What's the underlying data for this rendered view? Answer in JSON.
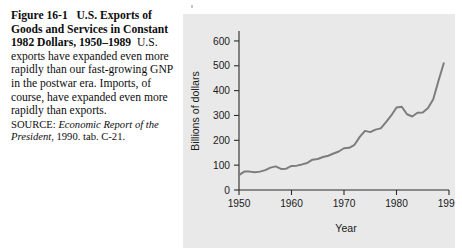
{
  "caption": {
    "lead_figure": "Figure 16-1",
    "lead_title": "U.S. Exports of Goods and Services in Constant 1982 Dollars, 1950–1989",
    "body": "U.S. exports have expanded even more rapidly than our fast-growing GNP in the postwar era. Imports, of course, have expanded even more rapidly than exports.",
    "source_label": "SOURCE: ",
    "source_title": "Economic Report of the President",
    "source_rest": ", 1990. tab. C-21."
  },
  "colors": {
    "panel_background": "#e9e9e9",
    "series_line": "#7d7d7d",
    "axis": "#2b2b2b",
    "text": "#1a1a1a"
  },
  "chart_data": {
    "type": "line",
    "title": "",
    "xlabel": "Year",
    "ylabel": "Billions of dollars",
    "xlim": [
      1950,
      1990
    ],
    "ylim": [
      0,
      640
    ],
    "xticks": [
      1950,
      1960,
      1970,
      1980,
      1990
    ],
    "xtick_labels": [
      "1950",
      "1960",
      "1970",
      "1980",
      "1990"
    ],
    "yticks": [
      0,
      100,
      200,
      300,
      400,
      500,
      600
    ],
    "ytick_labels": [
      "0",
      "100",
      "200",
      "300",
      "400",
      "500",
      "600"
    ],
    "grid": false,
    "legend": "none",
    "series": [
      {
        "name": "U.S. exports of goods and services (constant 1982 dollars)",
        "x": [
          1950,
          1951,
          1952,
          1953,
          1954,
          1955,
          1956,
          1957,
          1958,
          1959,
          1960,
          1961,
          1962,
          1963,
          1964,
          1965,
          1966,
          1967,
          1968,
          1969,
          1970,
          1971,
          1972,
          1973,
          1974,
          1975,
          1976,
          1977,
          1978,
          1979,
          1980,
          1981,
          1982,
          1983,
          1984,
          1985,
          1986,
          1987,
          1988,
          1989
        ],
        "values": [
          60,
          74,
          74,
          71,
          74,
          80,
          90,
          95,
          85,
          86,
          97,
          98,
          103,
          109,
          122,
          125,
          133,
          138,
          147,
          155,
          168,
          170,
          182,
          214,
          238,
          233,
          243,
          248,
          273,
          300,
          332,
          335,
          305,
          296,
          311,
          312,
          330,
          365,
          440,
          510
        ]
      }
    ],
    "annotations": []
  }
}
